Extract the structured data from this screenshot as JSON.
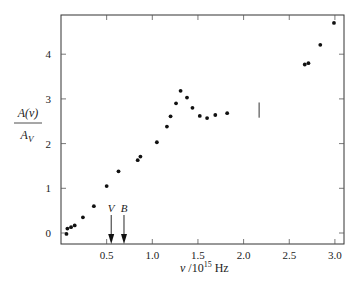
{
  "chart_data": {
    "type": "scatter",
    "title": "",
    "xlabel": "ν /10^15 Hz",
    "ylabel": "A(ν) / A_V",
    "xlim": [
      0,
      3.1
    ],
    "ylim": [
      -0.25,
      4.9
    ],
    "x_ticks": [
      "0.5",
      "1.0",
      "1.5",
      "2.0",
      "2.5",
      "3.0"
    ],
    "y_ticks": [
      "0",
      "1",
      "2",
      "3",
      "4"
    ],
    "grid": false,
    "legend": null,
    "points": [
      {
        "x": 0.06,
        "y": -0.02
      },
      {
        "x": 0.07,
        "y": 0.1
      },
      {
        "x": 0.11,
        "y": 0.13
      },
      {
        "x": 0.15,
        "y": 0.17
      },
      {
        "x": 0.24,
        "y": 0.35
      },
      {
        "x": 0.36,
        "y": 0.6
      },
      {
        "x": 0.5,
        "y": 1.05
      },
      {
        "x": 0.63,
        "y": 1.38
      },
      {
        "x": 0.84,
        "y": 1.63
      },
      {
        "x": 0.87,
        "y": 1.71
      },
      {
        "x": 1.05,
        "y": 2.03
      },
      {
        "x": 1.16,
        "y": 2.38
      },
      {
        "x": 1.2,
        "y": 2.61
      },
      {
        "x": 1.26,
        "y": 2.9
      },
      {
        "x": 1.31,
        "y": 3.18
      },
      {
        "x": 1.38,
        "y": 3.03
      },
      {
        "x": 1.44,
        "y": 2.8
      },
      {
        "x": 1.52,
        "y": 2.62
      },
      {
        "x": 1.6,
        "y": 2.57
      },
      {
        "x": 1.69,
        "y": 2.64
      },
      {
        "x": 1.82,
        "y": 2.68
      },
      {
        "x": 2.67,
        "y": 3.77
      },
      {
        "x": 2.71,
        "y": 3.8
      },
      {
        "x": 2.84,
        "y": 4.21
      },
      {
        "x": 2.99,
        "y": 4.7
      }
    ],
    "error_bar": {
      "x": 2.17,
      "y_low": 2.58,
      "y_high": 2.92
    },
    "annotations": [
      {
        "label": "V",
        "x": 0.55,
        "type": "arrow-down"
      },
      {
        "label": "B",
        "x": 0.69,
        "type": "arrow-down"
      }
    ]
  }
}
